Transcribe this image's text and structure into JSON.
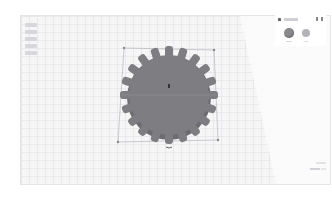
{
  "app": {
    "name": "3D design editor"
  },
  "viewport": {
    "view_cube_label": "",
    "selected_shape": "gear",
    "dimension_top": "",
    "dimension_bottom": "",
    "colors": {
      "workplane": "#f6f6f7",
      "grid_line": "#e9e9ec",
      "shape_fill": "#7d7d82",
      "shape_edge": "#5f5f64",
      "selection_box": "#a9a9b2"
    }
  },
  "shape_panel": {
    "title": "Shape",
    "lock_icon": "lock-icon",
    "light_icon": "lightbulb-icon",
    "options": [
      {
        "label": "Solid",
        "color": "#8a8a8f",
        "selected": true
      },
      {
        "label": "Hole",
        "color": "#b4b4b8",
        "selected": false
      }
    ]
  },
  "status_bar": {
    "edit_grid_label": "",
    "snap_grid_label": ""
  }
}
